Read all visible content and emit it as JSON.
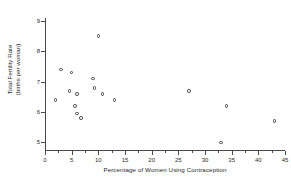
{
  "chart_data": {
    "type": "scatter",
    "title": "",
    "xlabel": "Percentage of Women Using Contraception",
    "ylabel": "Total Fertility Rate (births per woman)",
    "ylabel_line1": "Total Fertility Rate",
    "ylabel_line2": "(births per woman)",
    "xlim": [
      0,
      45
    ],
    "ylim": [
      4.75,
      9.1
    ],
    "xticks": [
      0,
      5,
      10,
      15,
      20,
      25,
      30,
      35,
      40,
      45
    ],
    "xtick_labels": [
      "0",
      "5",
      "10",
      "15",
      "20",
      "25",
      "30",
      "35",
      "40",
      "45"
    ],
    "yticks": [
      5,
      6,
      7,
      8,
      9
    ],
    "ytick_labels": [
      "5",
      "6",
      "7",
      "8",
      "9"
    ],
    "x_minor_tick_step": 2.5,
    "grid": false,
    "legend": null,
    "marker": "open-circle",
    "marker_color": "#3d3d3d",
    "points": [
      {
        "x": 2.0,
        "y": 6.4
      },
      {
        "x": 3.0,
        "y": 7.4
      },
      {
        "x": 4.6,
        "y": 6.7
      },
      {
        "x": 5.0,
        "y": 7.3
      },
      {
        "x": 5.6,
        "y": 6.2
      },
      {
        "x": 6.0,
        "y": 6.6
      },
      {
        "x": 6.0,
        "y": 5.95
      },
      {
        "x": 6.8,
        "y": 5.8
      },
      {
        "x": 9.0,
        "y": 7.1
      },
      {
        "x": 9.3,
        "y": 6.8
      },
      {
        "x": 10.0,
        "y": 8.5
      },
      {
        "x": 10.8,
        "y": 6.6
      },
      {
        "x": 13.0,
        "y": 6.4
      },
      {
        "x": 27.0,
        "y": 6.7
      },
      {
        "x": 33.0,
        "y": 5.0
      },
      {
        "x": 34.0,
        "y": 6.2
      },
      {
        "x": 43.0,
        "y": 5.7
      }
    ]
  }
}
